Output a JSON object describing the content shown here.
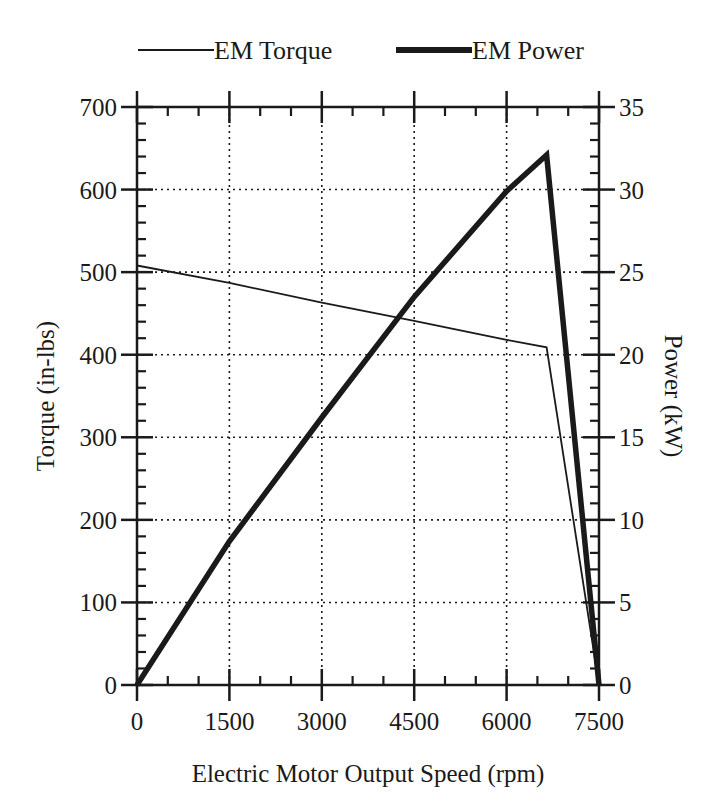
{
  "chart_data": {
    "type": "line",
    "title": "",
    "xlabel": "Electric Motor Output Speed (rpm)",
    "ylabel": "Torque (in-lbs)",
    "y2label": "Power (kW)",
    "xlim": [
      0,
      7500
    ],
    "ylim": [
      0,
      700
    ],
    "y2lim": [
      0,
      35
    ],
    "x_ticks": [
      0,
      1500,
      3000,
      4500,
      6000,
      7500
    ],
    "y_ticks": [
      0,
      100,
      200,
      300,
      400,
      500,
      600,
      700
    ],
    "y2_ticks": [
      0,
      5,
      10,
      15,
      20,
      25,
      30,
      35
    ],
    "grid": "dotted",
    "legend_position": "top",
    "series": [
      {
        "name": "EM Torque",
        "axis": "left",
        "style": "thin",
        "x": [
          0,
          1500,
          3000,
          4500,
          6000,
          6650,
          7500
        ],
        "values": [
          508,
          487,
          463,
          441,
          418,
          409,
          0
        ]
      },
      {
        "name": "EM Power",
        "axis": "right",
        "style": "thick",
        "x": [
          0,
          1500,
          3000,
          4500,
          6000,
          6650,
          7500
        ],
        "values": [
          0,
          8.7,
          16.2,
          23.5,
          29.9,
          32.1,
          0
        ]
      }
    ]
  },
  "legend": {
    "torque_label": "EM Torque",
    "power_label": "EM Power"
  },
  "colors": {
    "ink": "#1a1a1a",
    "background": "#ffffff"
  }
}
